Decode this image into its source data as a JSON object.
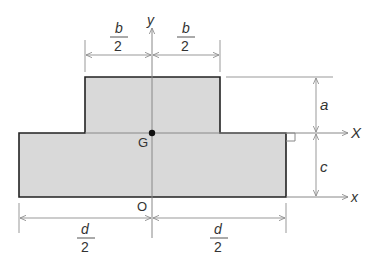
{
  "diagram": {
    "type": "cross-section",
    "fill_color": "#d9d9d9",
    "outline_color": "#222222",
    "line_color": "#888888",
    "labels": {
      "y_axis": "y",
      "X_axis": "X",
      "x_axis": "x",
      "centroid": "G",
      "origin": "O",
      "a": "a",
      "c": "c",
      "b_num": "b",
      "b_den": "2",
      "d_num": "d",
      "d_den": "2"
    }
  }
}
